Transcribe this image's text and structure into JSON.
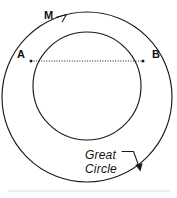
{
  "figure": {
    "name": "great-circle-geometry-diagram",
    "width": 177,
    "height": 198,
    "background_color": "#ffffff",
    "ink_color": "#1a1a1a",
    "baseline_color": "#d8d8d8"
  },
  "labels": {
    "m": "M",
    "a": "A",
    "b": "B",
    "great_circle_line1": "Great",
    "great_circle_line2": "Circle"
  },
  "geometry": {
    "great_circle": {
      "label": "Great Circle",
      "center_x": 87,
      "center_y": 97,
      "radius": 85
    },
    "small_circle": {
      "label": "M",
      "center_x": 87,
      "center_y": 86,
      "radius": 54
    },
    "point_a": {
      "label": "A",
      "x": 31,
      "y": 61
    },
    "point_b": {
      "label": "B",
      "x": 143,
      "y": 61
    },
    "chord_ab": {
      "label": "chord A to B",
      "style": "dotted",
      "x1": 31,
      "y1": 61,
      "x2": 143,
      "y2": 61
    },
    "m_leader": {
      "label": "M leader line",
      "path": "M 56.5 17.5 L 66 15 L 62.5 21.5"
    },
    "great_circle_leader": {
      "label": "Great Circle leader line with arrow",
      "path": "M 123 151 L 133 151 L 139 167",
      "arrow_tip_x": 140,
      "arrow_tip_y": 171
    },
    "baseline": {
      "label": "faint bottom rule",
      "x1": 8,
      "y1": 191,
      "x2": 170,
      "y2": 191
    }
  }
}
